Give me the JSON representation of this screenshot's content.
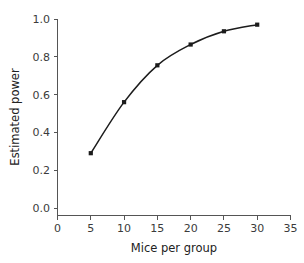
{
  "chart_data": {
    "type": "line",
    "title": "",
    "xlabel": "Mice per group",
    "ylabel": "Estimated power",
    "x": [
      5,
      10,
      15,
      20,
      25,
      30
    ],
    "values": [
      0.29,
      0.56,
      0.755,
      0.865,
      0.935,
      0.97
    ],
    "series": [
      {
        "name": "Estimated power",
        "x": [
          5,
          10,
          15,
          20,
          25,
          30
        ],
        "values": [
          0.29,
          0.56,
          0.755,
          0.865,
          0.935,
          0.97
        ]
      }
    ],
    "xlim": [
      0,
      35
    ],
    "ylim": [
      0.0,
      1.0
    ],
    "xticks": [
      0,
      5,
      10,
      15,
      20,
      25,
      30,
      35
    ],
    "xtick_labels": [
      "0",
      "5",
      "10",
      "15",
      "20",
      "25",
      "30",
      "35"
    ],
    "yticks": [
      0.0,
      0.2,
      0.4,
      0.6,
      0.8,
      1.0
    ],
    "ytick_labels": [
      "0.0",
      "0.2",
      "0.4",
      "0.6",
      "0.8",
      "1.0"
    ],
    "grid": false,
    "legend": null,
    "legend_position": "none",
    "marker": "square",
    "line_color": "#1c1c1c",
    "marker_color": "#1c1c1c",
    "axis_color": "#555555",
    "background_color": "#ffffff"
  }
}
